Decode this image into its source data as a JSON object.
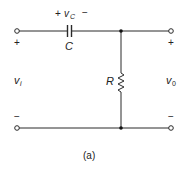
{
  "diagram": {
    "caption": "(a)",
    "colors": {
      "wire": "#2a2a2a",
      "background": "#ffffff"
    },
    "components": {
      "capacitor": {
        "label": "C",
        "voltage_label": "v",
        "voltage_sub": "C",
        "plus": "+",
        "minus": "−"
      },
      "resistor": {
        "label": "R"
      }
    },
    "terminals": {
      "input": {
        "label": "v",
        "sub": "i",
        "plus": "+",
        "minus": "−"
      },
      "output": {
        "label": "v",
        "sub": "0",
        "plus": "+",
        "minus": "−"
      }
    }
  }
}
